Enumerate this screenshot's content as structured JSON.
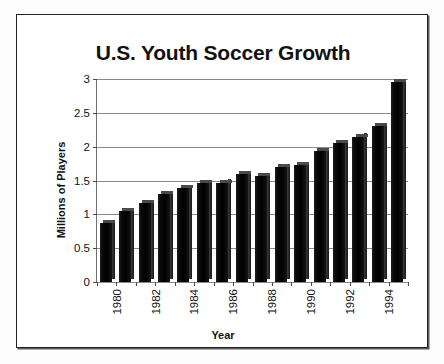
{
  "figure": {
    "title": "U.S. Youth Soccer Growth",
    "frame_border_color": "#232323",
    "background_color": "#ffffff",
    "bar_color": "#0b0b0b",
    "gridline_color": "#8a8a8a"
  },
  "chart_data": {
    "type": "bar",
    "title": "U.S. Youth Soccer Growth",
    "xlabel": "Year",
    "ylabel": "Millions of Players",
    "categories": [
      "1980",
      "1981",
      "1982",
      "1983",
      "1984",
      "1985",
      "1986",
      "1987",
      "1988",
      "1989",
      "1990",
      "1991",
      "1992",
      "1993",
      "1994",
      "1995"
    ],
    "values": [
      0.87,
      1.05,
      1.17,
      1.3,
      1.39,
      1.46,
      1.47,
      1.59,
      1.57,
      1.7,
      1.73,
      1.93,
      2.05,
      2.15,
      2.3,
      2.95
    ],
    "ylim": [
      0,
      3
    ],
    "yticks": [
      "0",
      "0.5",
      "1",
      "1.5",
      "2",
      "2.5",
      "3"
    ],
    "ytick_values": [
      0,
      0.5,
      1,
      1.5,
      2,
      2.5,
      3
    ],
    "xtick_labels": [
      "1980",
      "",
      "1982",
      "",
      "1984",
      "",
      "1986",
      "",
      "1988",
      "",
      "1990",
      "",
      "1992",
      "",
      "1994",
      ""
    ],
    "grid": true,
    "grid_axis": "y",
    "legend": false,
    "bar_style": "3d-solid-black"
  }
}
